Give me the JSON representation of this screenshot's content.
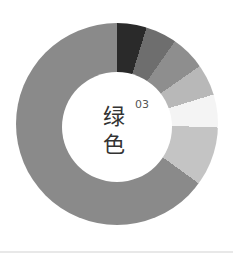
{
  "title": {
    "line1": "绿",
    "line2": "色",
    "number": "03"
  },
  "chart_data": {
    "type": "pie",
    "subtype": "donut",
    "start_angle_deg": 0,
    "direction": "clockwise",
    "segments": [
      {
        "value": 17,
        "color": "#2a2a2a"
      },
      {
        "value": 18,
        "color": "#6e6e6e"
      },
      {
        "value": 20,
        "color": "#8e8e8e"
      },
      {
        "value": 18,
        "color": "#b8b8b8"
      },
      {
        "value": 19,
        "color": "#f4f4f4"
      },
      {
        "value": 34,
        "color": "#c4c4c4"
      },
      {
        "value": 234,
        "color": "#8a8a8a"
      }
    ]
  }
}
